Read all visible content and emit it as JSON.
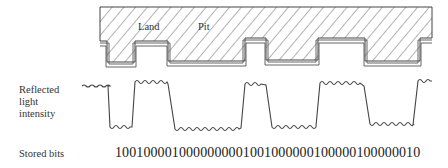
{
  "profile": {
    "land_label": "Land",
    "pit_label": "Pit"
  },
  "signal": {
    "label_lines": [
      "Reflected",
      "light",
      "intensity"
    ]
  },
  "bits": {
    "label": "Stored bits",
    "value": "1001000010000000001001000000100000100000010"
  }
}
